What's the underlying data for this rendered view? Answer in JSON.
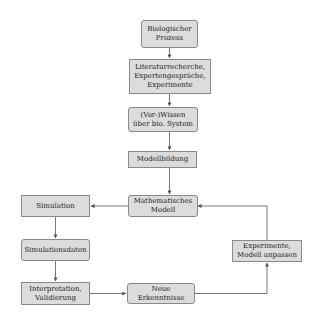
{
  "diagram": {
    "type": "flowchart",
    "nodes": [
      {
        "id": "n1",
        "label": "Biologischer\nProzess",
        "shape": "rounded"
      },
      {
        "id": "n2",
        "label": "Literaturrecherche,\nExpertengespräche,\nExperimente",
        "shape": "rect"
      },
      {
        "id": "n3",
        "label": "(Vor-)Wissen\nüber bio. System",
        "shape": "rounded"
      },
      {
        "id": "n4",
        "label": "Modellbildung",
        "shape": "rect"
      },
      {
        "id": "n5",
        "label": "Mathematisches\nModell",
        "shape": "rounded"
      },
      {
        "id": "n6",
        "label": "Simulation",
        "shape": "rect"
      },
      {
        "id": "n7",
        "label": "Simulationsdaten",
        "shape": "rounded"
      },
      {
        "id": "n8",
        "label": "Interpretation,\nValidierung",
        "shape": "rect"
      },
      {
        "id": "n9",
        "label": "Neue Erkenntnisse",
        "shape": "rounded"
      },
      {
        "id": "n10",
        "label": "Experimente,\nModell anpassen",
        "shape": "rect"
      }
    ],
    "edges": [
      {
        "from": "n1",
        "to": "n2"
      },
      {
        "from": "n2",
        "to": "n3"
      },
      {
        "from": "n3",
        "to": "n4"
      },
      {
        "from": "n4",
        "to": "n5"
      },
      {
        "from": "n5",
        "to": "n6"
      },
      {
        "from": "n6",
        "to": "n7"
      },
      {
        "from": "n7",
        "to": "n8"
      },
      {
        "from": "n8",
        "to": "n9"
      },
      {
        "from": "n9",
        "to": "n10"
      },
      {
        "from": "n10",
        "to": "n5"
      }
    ],
    "colors": {
      "fill": "#dcdcdc",
      "stroke": "#8a8a8a",
      "edge": "#555555"
    }
  }
}
